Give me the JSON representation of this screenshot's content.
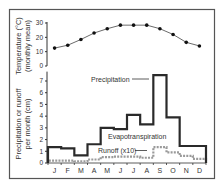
{
  "chart_data": [
    {
      "type": "line",
      "title": "",
      "xlabel": "",
      "ylabel": "Temperature (°C) (monthly mean)",
      "ylabel_line1": "Temperature (°C)",
      "ylabel_line2": "(monthly mean)",
      "categories": [
        "J",
        "F",
        "M",
        "A",
        "M",
        "J",
        "J",
        "A",
        "S",
        "O",
        "N",
        "D"
      ],
      "ylim": [
        0,
        30
      ],
      "yticks": [
        "0",
        "10",
        "20",
        "30"
      ],
      "grid": false,
      "series": [
        {
          "name": "Temperature",
          "values": [
            12.5,
            14.5,
            18.5,
            23,
            26,
            28.5,
            28.5,
            28.5,
            26,
            22,
            16.5,
            14
          ]
        }
      ]
    },
    {
      "type": "line",
      "title": "",
      "xlabel": "",
      "ylabel": "Precipitation or runoff per month (cm)",
      "ylabel_line1": "Precipitation or runoff",
      "ylabel_line2": "per month (cm)",
      "categories": [
        "J",
        "F",
        "M",
        "A",
        "M",
        "J",
        "J",
        "A",
        "S",
        "O",
        "N",
        "D"
      ],
      "ylim": [
        0,
        7.8
      ],
      "yticks": [
        "0",
        "1",
        "2",
        "3",
        "4",
        "5",
        "6",
        "7"
      ],
      "grid": false,
      "series": [
        {
          "name": "Precipitation",
          "style": "step",
          "values": [
            1.35,
            1.25,
            0.65,
            1.6,
            3.0,
            2.9,
            4.1,
            3.3,
            7.5,
            3.9,
            1.45,
            1.45
          ]
        },
        {
          "name": "Runoff (x10)",
          "style": "dashed-step",
          "values": [
            0.2,
            0.2,
            0.15,
            0.3,
            0.5,
            0.55,
            0.55,
            0.45,
            1.35,
            0.9,
            0.6,
            0.35
          ]
        }
      ],
      "annotations": [
        {
          "text": "Precipitation",
          "points_to": "S"
        },
        {
          "text": "Evapotranspiration",
          "region": "between precipitation and runoff"
        },
        {
          "text": "Runoff (x10)",
          "points_to": "A-S"
        }
      ]
    }
  ],
  "colors": {
    "frame": "#555555",
    "precip": "#2a2a2a",
    "runoff": "#999999",
    "temp_line": "#333333",
    "text": "#333333"
  }
}
